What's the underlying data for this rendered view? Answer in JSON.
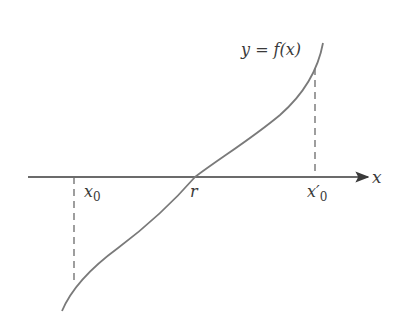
{
  "diagram": {
    "curve_label": "y = f(x)",
    "axis_label": "x",
    "points": [
      {
        "id": "x0",
        "label": "x",
        "subscript": "0"
      },
      {
        "id": "r",
        "label": "r"
      },
      {
        "id": "x0_prime",
        "label": "x′",
        "subscript": "0"
      }
    ],
    "colors": {
      "curve": "#7a7a7a",
      "axis": "#3a3a3a",
      "dashed": "#6a6a6a",
      "text": "#3a3a3a"
    }
  }
}
